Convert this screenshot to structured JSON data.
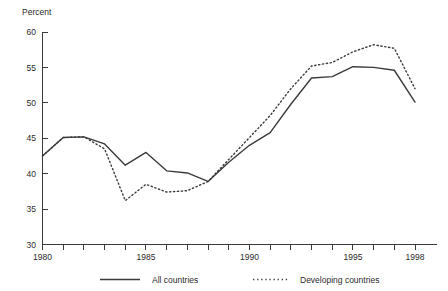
{
  "chart_data": {
    "type": "line",
    "title": "",
    "xlabel": "",
    "ylabel": "Percent",
    "ylim": [
      30,
      60
    ],
    "xlim": [
      1980,
      1998
    ],
    "yticks": [
      30,
      35,
      40,
      45,
      50,
      55,
      60
    ],
    "ytick_labels": [
      "30",
      "35",
      "40",
      "45",
      "50",
      "55",
      "60"
    ],
    "xticks": [
      1980,
      1981,
      1982,
      1983,
      1984,
      1985,
      1986,
      1987,
      1988,
      1989,
      1990,
      1991,
      1992,
      1993,
      1994,
      1995,
      1996,
      1997,
      1998
    ],
    "xtick_labels_shown": [
      "1980",
      "1985",
      "1990",
      "1995",
      "1998"
    ],
    "xtick_labels_positions": [
      1980,
      1985,
      1990,
      1995,
      1998
    ],
    "grid": false,
    "legend_position": "bottom",
    "x": [
      1980,
      1981,
      1982,
      1983,
      1984,
      1985,
      1986,
      1987,
      1988,
      1989,
      1990,
      1991,
      1992,
      1993,
      1994,
      1995,
      1996,
      1997,
      1998
    ],
    "series": [
      {
        "name": "All countries",
        "style": "solid",
        "color": "#3b3b3b",
        "values": [
          42.5,
          45.1,
          45.2,
          44.2,
          41.2,
          43.0,
          40.4,
          40.1,
          38.9,
          41.6,
          44.0,
          45.8,
          49.8,
          53.5,
          53.7,
          55.1,
          55.0,
          54.6,
          50.1
        ]
      },
      {
        "name": "Developing countries",
        "style": "dotted",
        "color": "#3b3b3b",
        "values": [
          42.5,
          45.1,
          45.2,
          43.5,
          36.2,
          38.5,
          37.4,
          37.6,
          38.9,
          42.0,
          45.1,
          48.2,
          52.0,
          55.2,
          55.7,
          57.2,
          58.2,
          57.7,
          52.0
        ]
      }
    ],
    "legend": [
      {
        "label": "All countries",
        "style": "solid"
      },
      {
        "label": "Developing countries",
        "style": "dotted"
      }
    ]
  },
  "axis": {
    "y_title": "Percent"
  }
}
